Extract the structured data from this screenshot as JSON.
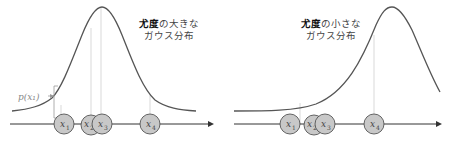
{
  "panels": [
    {
      "id": "high-likelihood",
      "title_bold": "尤度",
      "title_rest_line1": "の大きな",
      "title_line2": "ガウス分布",
      "annotation": "p(x₁)",
      "points": [
        {
          "label": "x",
          "sub": "1"
        },
        {
          "label": "x",
          "sub": "2"
        },
        {
          "label": "x",
          "sub": "3"
        },
        {
          "label": "x",
          "sub": "4"
        }
      ]
    },
    {
      "id": "low-likelihood",
      "title_bold": "尤度",
      "title_rest_line1": "の小さな",
      "title_line2": "ガウス分布",
      "points": [
        {
          "label": "x",
          "sub": "1"
        },
        {
          "label": "x",
          "sub": "2"
        },
        {
          "label": "x",
          "sub": "3"
        },
        {
          "label": "x",
          "sub": "4"
        }
      ]
    }
  ],
  "colors": {
    "curve": "#555555",
    "axis": "#333333",
    "point_fill": "#c8c8c8",
    "point_stroke": "#555555",
    "guide": "#cfcfcf",
    "annotation": "#888888"
  }
}
